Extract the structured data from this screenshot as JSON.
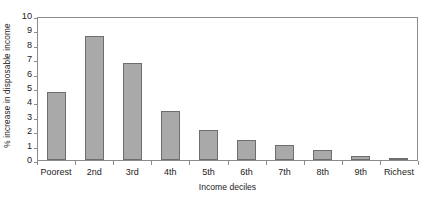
{
  "chart_data": {
    "type": "bar",
    "title": "",
    "xlabel": "Income deciles",
    "ylabel": "% increase in disposable income",
    "categories": [
      "Poorest",
      "2nd",
      "3rd",
      "4th",
      "5th",
      "6th",
      "7th",
      "8th",
      "9th",
      "Richest"
    ],
    "values": [
      4.7,
      8.6,
      6.75,
      3.4,
      2.1,
      1.4,
      1.05,
      0.7,
      0.3,
      0.05
    ],
    "series": [
      {
        "name": "% increase in disposable income",
        "values": [
          4.7,
          8.6,
          6.75,
          3.4,
          2.1,
          1.4,
          1.05,
          0.7,
          0.3,
          0.05
        ]
      }
    ],
    "ylim": [
      0,
      10
    ],
    "yticks": [
      0,
      1,
      2,
      3,
      4,
      5,
      6,
      7,
      8,
      9,
      10
    ],
    "ytick_labels": [
      "0",
      "1",
      "2",
      "3",
      "4",
      "5",
      "6",
      "7",
      "8",
      "9",
      "10"
    ],
    "grid": false,
    "legend": "none",
    "bar_color": "#a9a9a9",
    "bar_edge_color": "#6e6e6e",
    "axis_color": "#8c8c8c"
  }
}
